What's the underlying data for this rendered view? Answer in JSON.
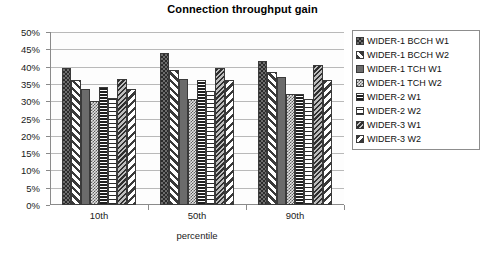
{
  "chart_data": {
    "type": "bar",
    "title": "Connection throughput gain",
    "xlabel": "percentile",
    "ylabel": "",
    "categories": [
      "10th",
      "50th",
      "90th"
    ],
    "ylim": [
      0,
      50
    ],
    "ytick_step": 5,
    "ytick_labels": [
      "50%",
      "45%",
      "40%",
      "35%",
      "30%",
      "25%",
      "20%",
      "15%",
      "10%",
      "5%",
      "0%"
    ],
    "ytick_values": [
      50,
      45,
      40,
      35,
      30,
      25,
      20,
      15,
      10,
      5,
      0
    ],
    "grid": true,
    "legend_position": "right",
    "value_unit": "%",
    "series": [
      {
        "name": "WIDER-1 BCCH W1",
        "pattern": "checker-dark",
        "values": [
          39.5,
          44.0,
          41.5
        ]
      },
      {
        "name": "WIDER-1 BCCH W2",
        "pattern": "diagonal-up-wide",
        "values": [
          36.0,
          39.0,
          38.5
        ]
      },
      {
        "name": "WIDER-1 TCH W1",
        "pattern": "solid-grey",
        "values": [
          33.5,
          36.5,
          37.0
        ]
      },
      {
        "name": "WIDER-1 TCH W2",
        "pattern": "checker-light",
        "values": [
          30.0,
          30.5,
          32.0
        ]
      },
      {
        "name": "WIDER-2 W1",
        "pattern": "horizontal-dense",
        "values": [
          34.0,
          36.0,
          32.0
        ]
      },
      {
        "name": "WIDER-2 W2",
        "pattern": "horizontal-sparse",
        "values": [
          31.0,
          33.0,
          30.5
        ]
      },
      {
        "name": "WIDER-3 W1",
        "pattern": "diagonal-down-dense",
        "values": [
          36.5,
          39.5,
          40.5
        ]
      },
      {
        "name": "WIDER-3 W2",
        "pattern": "diagonal-down-wide",
        "values": [
          33.5,
          36.0,
          36.0
        ]
      }
    ]
  }
}
